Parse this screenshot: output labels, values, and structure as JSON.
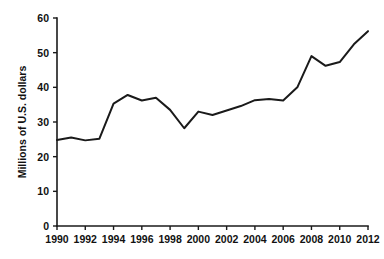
{
  "chart_data": {
    "type": "line",
    "title": "",
    "xlabel": "",
    "ylabel": "Millions of U.S. dollars",
    "xlim": [
      1990,
      2012
    ],
    "ylim": [
      0,
      60
    ],
    "grid": false,
    "legend": "none",
    "line_color": "#1a1a1a",
    "background_color": "#ffffff",
    "x_tick_labels": [
      "1990",
      "1992",
      "1994",
      "1996",
      "1998",
      "2000",
      "2002",
      "2004",
      "2006",
      "2008",
      "2010",
      "2012"
    ],
    "x_tick_values": [
      1990,
      1992,
      1994,
      1996,
      1998,
      2000,
      2002,
      2004,
      2006,
      2008,
      2010,
      2012
    ],
    "y_tick_labels": [
      "0",
      "10",
      "20",
      "30",
      "40",
      "50",
      "60"
    ],
    "y_tick_values": [
      0,
      10,
      20,
      30,
      40,
      50,
      60
    ],
    "x": [
      1990,
      1991,
      1992,
      1993,
      1994,
      1995,
      1996,
      1997,
      1998,
      1999,
      2000,
      2001,
      2002,
      2003,
      2004,
      2005,
      2006,
      2007,
      2008,
      2009,
      2010,
      2011,
      2012
    ],
    "values": [
      24.8,
      25.5,
      24.7,
      25.2,
      35.3,
      37.8,
      36.2,
      37.0,
      33.5,
      28.2,
      33.0,
      32.0,
      33.3,
      34.6,
      36.3,
      36.6,
      36.2,
      40.0,
      49.0,
      46.2,
      47.3,
      52.4,
      56.2
    ],
    "series": [
      {
        "name": "Value",
        "values": [
          24.8,
          25.5,
          24.7,
          25.2,
          35.3,
          37.8,
          36.2,
          37.0,
          33.5,
          28.2,
          33.0,
          32.0,
          33.3,
          34.6,
          36.3,
          36.6,
          36.2,
          40.0,
          49.0,
          46.2,
          47.3,
          52.4,
          56.2
        ]
      }
    ]
  }
}
